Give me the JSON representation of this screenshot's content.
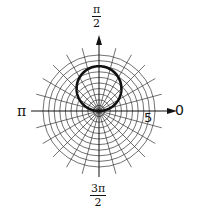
{
  "chart_data": {
    "type": "polar",
    "title": "",
    "equation": "r = 4 sin θ",
    "curve": {
      "kind": "circle",
      "diameter": 4,
      "center": [
        0,
        2
      ],
      "r_of_theta": "4*sin(theta)",
      "line_width": "thick",
      "color": "#111111"
    },
    "radial_grid": {
      "rings": 10,
      "ring_step": 0.5,
      "max_r": 5
    },
    "angular_grid": {
      "spokes": 24,
      "step_degrees": 15
    },
    "labels": {
      "angle_0": "0",
      "angle_half_pi_num": "π",
      "angle_half_pi_den": "2",
      "angle_pi": "π",
      "angle_three_half_pi_num": "3π",
      "angle_three_half_pi_den": "2",
      "radial_tick": "5"
    },
    "axes": {
      "polar_axis_arrow": true,
      "vertical_axis_arrow": true
    }
  },
  "colors": {
    "grid": "#333333",
    "curve": "#111111",
    "background": "#ffffff"
  },
  "layout": {
    "cx": 99,
    "cy": 111,
    "px_per_unit": 11.2
  }
}
